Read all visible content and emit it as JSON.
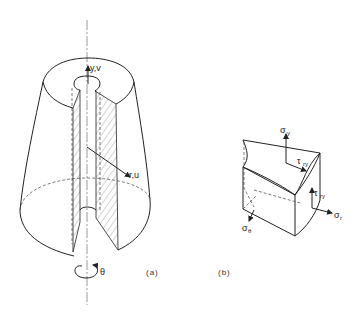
{
  "figure_a": {
    "caption": "(a)",
    "labels": {
      "axial": "y,v",
      "radial": "r,u",
      "circumferential": "θ"
    }
  },
  "figure_b": {
    "caption": "(b)",
    "labels": {
      "sigma_y": "σ",
      "sigma_y_sub": "y",
      "tau_ry_top": "τ",
      "tau_ry_top_sub": "ry",
      "tau_ry_side": "τ",
      "tau_ry_side_sub": "ry",
      "sigma_r": "σ",
      "sigma_r_sub": "r",
      "sigma_theta": "σ",
      "sigma_theta_sub": "θ"
    }
  },
  "colors": {
    "line": "#222222",
    "background": "#ffffff"
  }
}
